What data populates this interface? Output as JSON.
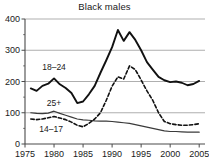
{
  "chart_data": {
    "type": "line",
    "title": "Black males",
    "xlabel": "",
    "ylabel": "",
    "xlim": [
      1975,
      2006
    ],
    "ylim": [
      0,
      400
    ],
    "yticks": [
      0,
      100,
      200,
      300,
      400
    ],
    "ytick_labels": [
      "0",
      "100",
      "200",
      "300",
      "400"
    ],
    "yminor_ticks": [
      50,
      150,
      250,
      350
    ],
    "xticks": [
      1975,
      1980,
      1985,
      1990,
      1995,
      2000,
      2005
    ],
    "xtick_labels": [
      "1975",
      "1980",
      "1985",
      "1990",
      "1995",
      "2000",
      "2005"
    ],
    "grid": "horizontal",
    "legend_position": "inline-annotations",
    "x": [
      1976,
      1977,
      1978,
      1979,
      1980,
      1981,
      1982,
      1983,
      1984,
      1985,
      1986,
      1987,
      1988,
      1989,
      1990,
      1991,
      1992,
      1993,
      1994,
      1995,
      1996,
      1997,
      1998,
      1999,
      2000,
      2001,
      2002,
      2003,
      2004,
      2005
    ],
    "series": [
      {
        "name": "18-24",
        "label": "18–24",
        "style": "solid-thick",
        "color": "#111111",
        "values": [
          178,
          170,
          186,
          193,
          210,
          191,
          179,
          163,
          131,
          136,
          159,
          186,
          228,
          268,
          310,
          365,
          330,
          358,
          333,
          300,
          262,
          238,
          215,
          204,
          198,
          200,
          196,
          188,
          192,
          202
        ]
      },
      {
        "name": "25+",
        "label": "25+",
        "style": "solid-thin",
        "color": "#3a3a3a",
        "values": [
          100,
          98,
          97,
          99,
          105,
          98,
          92,
          86,
          80,
          77,
          76,
          74,
          73,
          73,
          72,
          70,
          68,
          66,
          62,
          58,
          54,
          50,
          46,
          42,
          40,
          40,
          39,
          38,
          38,
          38
        ]
      },
      {
        "name": "14-17",
        "label": "14–17",
        "style": "dashed",
        "color": "#111111",
        "values": [
          80,
          78,
          80,
          84,
          88,
          83,
          78,
          70,
          60,
          55,
          66,
          80,
          100,
          140,
          185,
          215,
          208,
          250,
          238,
          205,
          170,
          140,
          100,
          72,
          65,
          62,
          60,
          60,
          62,
          65
        ]
      }
    ],
    "annotations": [
      {
        "name": "label-18-24",
        "text": "18–24",
        "x": 1980.0,
        "y": 238
      },
      {
        "name": "label-25plus",
        "text": "25+",
        "x": 1980.0,
        "y": 122
      },
      {
        "name": "label-14-17",
        "text": "14–17",
        "x": 1979.5,
        "y": 40
      }
    ]
  }
}
